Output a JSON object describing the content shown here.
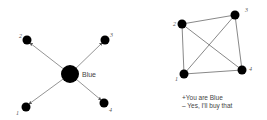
{
  "left_diagram": {
    "center_label": "Blue",
    "nodes": [
      {
        "id": "1",
        "label": "1"
      },
      {
        "id": "2",
        "label": "2"
      },
      {
        "id": "3",
        "label": "3"
      },
      {
        "id": "4",
        "label": "4"
      }
    ]
  },
  "right_diagram": {
    "nodes": [
      {
        "id": "1",
        "label": "1"
      },
      {
        "id": "2",
        "label": "2"
      },
      {
        "id": "3",
        "label": "3"
      },
      {
        "id": "4",
        "label": "4"
      }
    ],
    "edges": [
      [
        "1",
        "2"
      ],
      [
        "2",
        "3"
      ],
      [
        "3",
        "4"
      ],
      [
        "4",
        "1"
      ],
      [
        "1",
        "3"
      ],
      [
        "2",
        "4"
      ]
    ]
  },
  "caption": {
    "line1": "+You are Blue",
    "line2": "– Yes, I'll buy that"
  }
}
